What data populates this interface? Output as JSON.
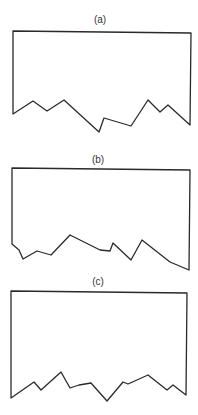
{
  "figure": {
    "panels": [
      {
        "label": "(a)",
        "label_pos": [
          100,
          23
        ],
        "points": "13,31 191,33 190,125 168,105 160,112 148,100 131,126 104,118 99,132 64,100 47,111 33,101 13,114"
      },
      {
        "label": "(b)",
        "label_pos": [
          98,
          163
        ],
        "points": "12,168 190,170 189,270 170,262 142,240 131,260 113,243 110,251 100,250 70,235 51,255 37,251 23,259 19,250 12,244"
      },
      {
        "label": "(c)",
        "label_pos": [
          98,
          285
        ],
        "points": "11,291 187,293 186,395 173,385 167,390 148,375 128,384 123,382 107,401 91,383 79,385 70,388 61,372 41,390 34,382 11,398"
      }
    ],
    "stroke_color": "#2a2a2a",
    "background": "#ffffff"
  }
}
